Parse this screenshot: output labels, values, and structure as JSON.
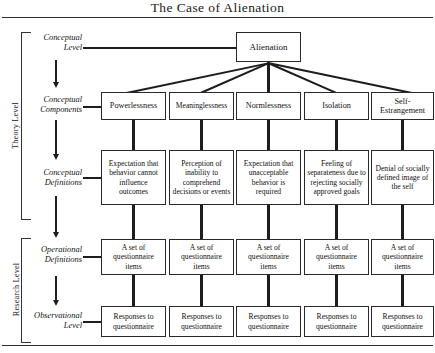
{
  "title": "The Case of Alienation",
  "levels": [
    {
      "name": "theory",
      "label": "Theory Level"
    },
    {
      "name": "research",
      "label": "Research Level"
    }
  ],
  "stages": [
    {
      "name": "conceptual-level",
      "line1": "Conceptual",
      "line2": "Level"
    },
    {
      "name": "conceptual-components",
      "line1": "Conceptual",
      "line2": "Components"
    },
    {
      "name": "conceptual-definitions",
      "line1": "Conceptual",
      "line2": "Definitions"
    },
    {
      "name": "operational-definitions",
      "line1": "Operational",
      "line2": "Definitions"
    },
    {
      "name": "observational-level",
      "line1": "Observational",
      "line2": "Level"
    }
  ],
  "root": {
    "label": "Alienation"
  },
  "columns": [
    {
      "component": "Powerlessness",
      "definition": "Expectation that behavior cannot influence outcomes",
      "operational": "A set of questionnaire items",
      "observational": "Responses to questionnaire"
    },
    {
      "component": "Meaninglessness",
      "definition": "Perception of inability to comprehend decisions or events",
      "operational": "A set of questionnaire items",
      "observational": "Responses to questionnaire"
    },
    {
      "component": "Normlessness",
      "definition": "Expectation that unacceptable behavior is required",
      "operational": "A set of questionnaire items",
      "observational": "Responses to questionnaire"
    },
    {
      "component": "Isolation",
      "definition": "Feeling of separateness due to rejecting socially approved goals",
      "operational": "A set of questionnaire items",
      "observational": "Responses to questionnaire"
    },
    {
      "component": "Self-Estrangement",
      "definition": "Denial of socially defined image of the self",
      "operational": "A set of questionnaire items",
      "observational": "Responses to questionnaire"
    }
  ],
  "colors": {
    "ink": "#1d1d1d",
    "border": "#2a2a2a",
    "background": "#ffffff"
  }
}
